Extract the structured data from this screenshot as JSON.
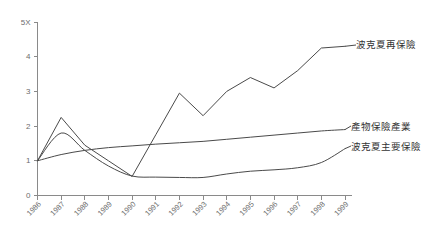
{
  "chart_data": {
    "type": "line",
    "title": "",
    "xlabel": "",
    "ylabel": "",
    "grid": false,
    "legend_position": "right-inline-labels",
    "x": [
      1986,
      1987,
      1988,
      1989,
      1990,
      1991,
      1992,
      1993,
      1994,
      1995,
      1996,
      1997,
      1998,
      1999
    ],
    "xtick_labels": [
      "1986",
      "1987",
      "1988",
      "1989",
      "1990",
      "1991",
      "1992",
      "1993",
      "1994",
      "1995",
      "1996",
      "1997",
      "1998",
      "1999"
    ],
    "ytick_labels": [
      "0",
      "1",
      "2",
      "3",
      "4",
      "5X"
    ],
    "ytick_values": [
      0,
      1,
      2,
      3,
      4,
      5
    ],
    "ylim": [
      0,
      5
    ],
    "xlim": [
      1986,
      1999
    ],
    "series": [
      {
        "name": "波克夏再保險",
        "smooth": false,
        "values": [
          1.0,
          2.25,
          1.45,
          1.0,
          0.55,
          1.75,
          2.95,
          2.3,
          3.0,
          3.4,
          3.1,
          3.6,
          4.25,
          4.3
        ]
      },
      {
        "name": "產物保險產業",
        "smooth": true,
        "values": [
          1.0,
          1.18,
          1.3,
          1.38,
          1.43,
          1.48,
          1.52,
          1.56,
          1.62,
          1.68,
          1.74,
          1.8,
          1.86,
          1.9
        ]
      },
      {
        "name": "波克夏主要保險",
        "smooth": true,
        "values": [
          1.0,
          1.8,
          1.3,
          0.85,
          0.56,
          0.53,
          0.52,
          0.52,
          0.62,
          0.7,
          0.74,
          0.8,
          0.95,
          1.35
        ]
      }
    ]
  },
  "legend": {
    "reinsurance": "波克夏再保險",
    "industry": "產物保險產業",
    "primary": "波克夏主要保險"
  },
  "colors": {
    "line": "#4a4a4a",
    "axis": "#8a8a8a",
    "text": "#6d6d6d",
    "background": "#ffffff"
  }
}
